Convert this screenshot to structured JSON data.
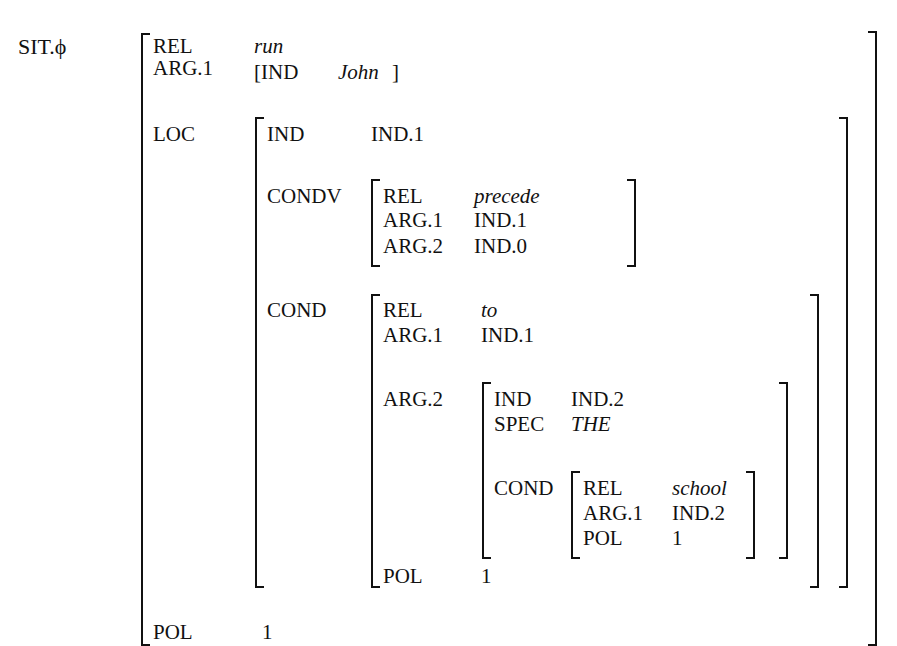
{
  "root_label": "SIT.ϕ",
  "top": {
    "rel_key": "REL",
    "rel_val": "run",
    "arg1_key": "ARG.1",
    "arg1_open": "[IND",
    "arg1_val": "John",
    "arg1_close": "]",
    "loc_key": "LOC",
    "pol_key": "POL",
    "pol_val": "1"
  },
  "loc": {
    "ind_key": "IND",
    "ind_val": "IND.1",
    "condv_key": "CONDV",
    "cond_key": "COND"
  },
  "condv": {
    "rel_key": "REL",
    "rel_val": "precede",
    "arg1_key": "ARG.1",
    "arg1_val": "IND.1",
    "arg2_key": "ARG.2",
    "arg2_val": "IND.0"
  },
  "cond": {
    "rel_key": "REL",
    "rel_val": "to",
    "arg1_key": "ARG.1",
    "arg1_val": "IND.1",
    "arg2_key": "ARG.2",
    "pol_key": "POL",
    "pol_val": "1"
  },
  "arg2": {
    "ind_key": "IND",
    "ind_val": "IND.2",
    "spec_key": "SPEC",
    "spec_val": "THE",
    "cond_key": "COND"
  },
  "school": {
    "rel_key": "REL",
    "rel_val": "school",
    "arg1_key": "ARG.1",
    "arg1_val": "IND.2",
    "pol_key": "POL",
    "pol_val": "1"
  }
}
